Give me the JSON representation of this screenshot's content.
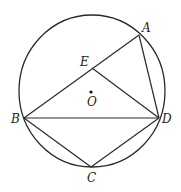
{
  "top_text": "·············",
  "diagram": {
    "type": "circle-geometry",
    "circle": {
      "center_label": "O",
      "cx": 92,
      "cy": 91,
      "rx": 73,
      "ry": 76,
      "stroke": "#2a2a2a"
    },
    "points": {
      "A": {
        "label": "A",
        "x": 139,
        "y": 35,
        "lx": 142,
        "ly": 32
      },
      "E": {
        "label": "E",
        "x": 92,
        "y": 68,
        "lx": 80,
        "ly": 66
      },
      "O": {
        "label": "O",
        "x": 91,
        "y": 92,
        "lx": 87,
        "ly": 106
      },
      "B": {
        "label": "B",
        "x": 24,
        "y": 118,
        "lx": 11,
        "ly": 123
      },
      "D": {
        "label": "D",
        "x": 159,
        "y": 118,
        "lx": 162,
        "ly": 123
      },
      "C": {
        "label": "C",
        "x": 91,
        "y": 167,
        "lx": 87,
        "ly": 182
      }
    },
    "segments": [
      [
        "B",
        "A"
      ],
      [
        "A",
        "D"
      ],
      [
        "E",
        "D"
      ],
      [
        "B",
        "D"
      ],
      [
        "B",
        "C"
      ],
      [
        "C",
        "D"
      ]
    ]
  }
}
